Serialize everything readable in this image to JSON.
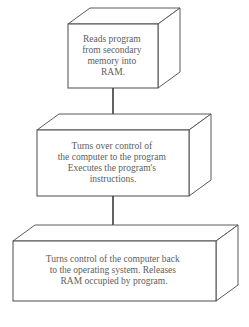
{
  "diagram": {
    "type": "flowchart",
    "orientation": "vertical",
    "background_color": "#ffffff",
    "line_color": "#4a4a4a",
    "text_color": "#5d5d5d",
    "arrow_color": "#2e2e2e",
    "nodes": [
      {
        "id": "node-1",
        "shape": "3d-box",
        "lines": [
          "Reads program",
          "from secondary",
          "memory into",
          "RAM."
        ],
        "font_size": 9.5,
        "front": {
          "x": 68,
          "y": 24,
          "w": 90,
          "h": 64
        },
        "depth": {
          "dx": 22,
          "dy": -16
        }
      },
      {
        "id": "node-2",
        "shape": "3d-box",
        "lines": [
          "Turns over control of",
          "the computer to the program",
          "Executes the program's",
          "instructions."
        ],
        "font_size": 9.5,
        "front": {
          "x": 37,
          "y": 130,
          "w": 152,
          "h": 66
        },
        "depth": {
          "dx": 22,
          "dy": -16
        }
      },
      {
        "id": "node-3",
        "shape": "3d-box",
        "lines": [
          "Turns control of the computer back",
          "to the operating system. Releases",
          "RAM occupied by program."
        ],
        "font_size": 9.5,
        "front": {
          "x": 13,
          "y": 241,
          "w": 203,
          "h": 60
        },
        "depth": {
          "dx": 22,
          "dy": -16
        }
      }
    ],
    "connectors": [
      {
        "id": "connector-1",
        "from": "node-1",
        "to": "node-2",
        "x": 113,
        "y_start": 88,
        "y_end": 130,
        "arrowhead": "solid-triangle"
      },
      {
        "id": "connector-2",
        "from": "node-2",
        "to": "node-3",
        "x": 113,
        "y_start": 196,
        "y_end": 241,
        "arrowhead": "solid-triangle"
      }
    ]
  }
}
